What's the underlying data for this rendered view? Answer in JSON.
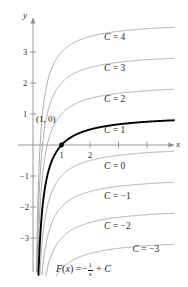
{
  "figure": {
    "formula_label": "F(x) = -1/x + C",
    "formula_parts": {
      "fn": "F",
      "open": "(",
      "var": "x",
      "close": ")",
      "equals": "=",
      "minus": "−",
      "numerator": "1",
      "denominator": "x",
      "plus": "+",
      "constant": "C"
    },
    "highlight_point": {
      "label": "(1, 0)",
      "x": 1,
      "y": 0
    },
    "axes": {
      "x_name": "x",
      "y_name": "y",
      "x_ticks": [
        {
          "value": 1,
          "label": "1"
        },
        {
          "value": 2,
          "label": "2"
        },
        {
          "value": 3,
          "label": ""
        },
        {
          "value": 4,
          "label": ""
        }
      ],
      "y_ticks": [
        {
          "value": 3,
          "label": "3"
        },
        {
          "value": 2,
          "label": "2"
        },
        {
          "value": 1,
          "label": "1"
        },
        {
          "value": -1,
          "label": "−1"
        },
        {
          "value": -2,
          "label": "−2"
        },
        {
          "value": -3,
          "label": "−3"
        }
      ]
    },
    "colors": {
      "curve": "#9a9a9a",
      "highlight_curve": "#000000",
      "axis": "#8d8d8d",
      "text": "#1f1f1f",
      "background": "#ffffff"
    }
  },
  "chart_data": {
    "type": "line",
    "xlabel": "x",
    "ylabel": "y",
    "xlim": [
      0,
      5
    ],
    "ylim": [
      -3.8,
      3.8
    ],
    "grid": false,
    "legend": "inline-curve-labels",
    "function_form": "F(x) = -1/x + C",
    "annotations": [
      {
        "text": "(1, 0)",
        "x": 1,
        "y": 0,
        "type": "point-label"
      },
      {
        "text": "F(x) = -1/x + C",
        "x": 2.2,
        "y": -3.75,
        "type": "formula"
      }
    ],
    "series": [
      {
        "name": "C = 4",
        "C": 4,
        "label": "C = 4",
        "label_text_c": "C",
        "label_text_eq": "=",
        "label_text_val": "4",
        "highlighted": false,
        "color": "#9a9a9a",
        "label_x": 2.6,
        "label_y": 3.45
      },
      {
        "name": "C = 3",
        "C": 3,
        "label": "C = 3",
        "label_text_c": "C",
        "label_text_eq": "=",
        "label_text_val": "3",
        "highlighted": false,
        "color": "#9a9a9a",
        "label_x": 2.6,
        "label_y": 2.45
      },
      {
        "name": "C = 2",
        "C": 2,
        "label": "C = 2",
        "label_text_c": "C",
        "label_text_eq": "=",
        "label_text_val": "2",
        "highlighted": false,
        "color": "#9a9a9a",
        "label_x": 2.6,
        "label_y": 1.45
      },
      {
        "name": "C = 1",
        "C": 1,
        "label": "C = 1",
        "label_text_c": "C",
        "label_text_eq": "=",
        "label_text_val": "1",
        "highlighted": true,
        "color": "#000000",
        "label_x": 2.6,
        "label_y": 0.45
      },
      {
        "name": "C = 0",
        "C": 0,
        "label": "C = 0",
        "label_text_c": "C",
        "label_text_eq": "=",
        "label_text_val": "0",
        "highlighted": false,
        "color": "#9a9a9a",
        "label_x": 2.6,
        "label_y": -0.72
      },
      {
        "name": "C = -1",
        "C": -1,
        "label": "C = −1",
        "label_text_c": "C",
        "label_text_eq": "=",
        "label_text_val": "−1",
        "highlighted": false,
        "color": "#9a9a9a",
        "label_x": 2.6,
        "label_y": -1.68
      },
      {
        "name": "C = -2",
        "C": -2,
        "label": "C = −2",
        "label_text_c": "C",
        "label_text_eq": "=",
        "label_text_val": "−2",
        "highlighted": false,
        "color": "#9a9a9a",
        "label_x": 2.6,
        "label_y": -2.65
      },
      {
        "name": "C = -3",
        "C": -3,
        "label": "C = −3",
        "label_text_c": "C",
        "label_text_eq": "=",
        "label_text_val": "−3",
        "highlighted": false,
        "color": "#9a9a9a",
        "label_x": 3.6,
        "label_y": -3.38
      }
    ]
  }
}
